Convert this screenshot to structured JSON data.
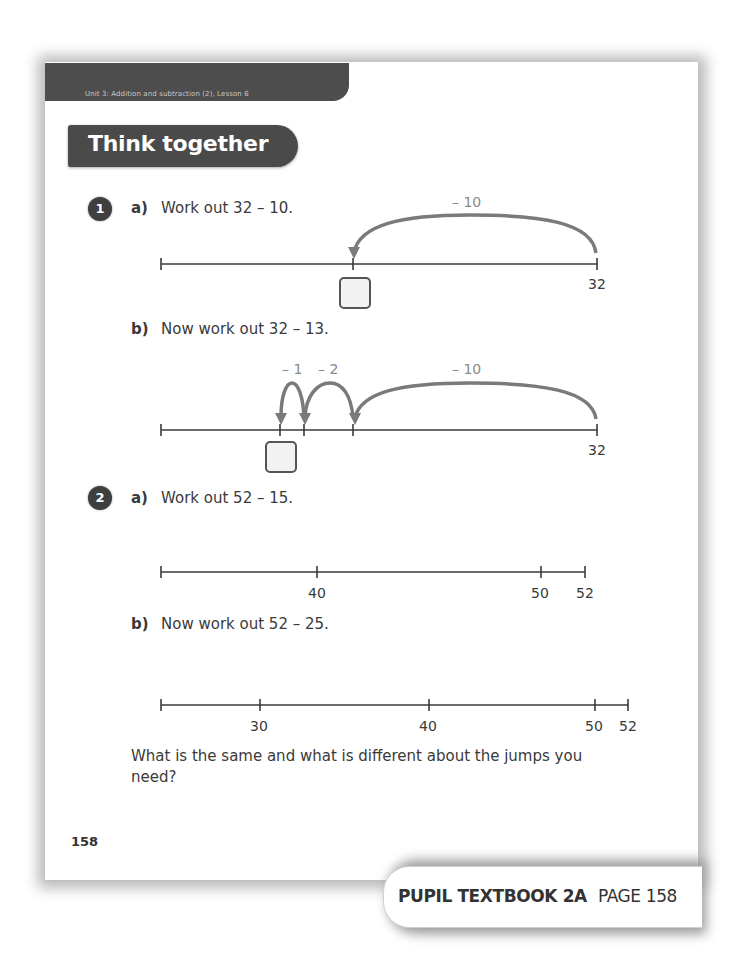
{
  "header": {
    "unit_label": "Unit 3: Addition and subtraction (2), Lesson 6",
    "section_title": "Think together"
  },
  "questions": [
    {
      "number": "1",
      "parts": [
        {
          "label": "a)",
          "prompt": "Work out 32 – 10.",
          "number_line": {
            "end_label": "32",
            "jumps": [
              {
                "label": "– 10"
              }
            ],
            "answer_box": ""
          }
        },
        {
          "label": "b)",
          "prompt": "Now work out 32 – 13.",
          "number_line": {
            "end_label": "32",
            "jumps": [
              {
                "label": "– 10"
              },
              {
                "label": "– 2"
              },
              {
                "label": "– 1"
              }
            ],
            "answer_box": ""
          }
        }
      ]
    },
    {
      "number": "2",
      "parts": [
        {
          "label": "a)",
          "prompt": "Work out 52 – 15.",
          "number_line": {
            "ticks": [
              "40",
              "50",
              "52"
            ]
          }
        },
        {
          "label": "b)",
          "prompt": "Now work out 52 – 25.",
          "number_line": {
            "ticks": [
              "30",
              "40",
              "50",
              "52"
            ]
          }
        }
      ],
      "follow_up": "What is the same and what is different about the jumps you need?"
    }
  ],
  "page_number": "158",
  "footer": {
    "book": "PUPIL TEXTBOOK 2A",
    "page": "PAGE 158"
  },
  "colors": {
    "header_bar": "#4d4d4d",
    "title_pill": "#4a4a4a",
    "jump_arrow": "#7a7a7a",
    "line": "#3a3a3a"
  }
}
